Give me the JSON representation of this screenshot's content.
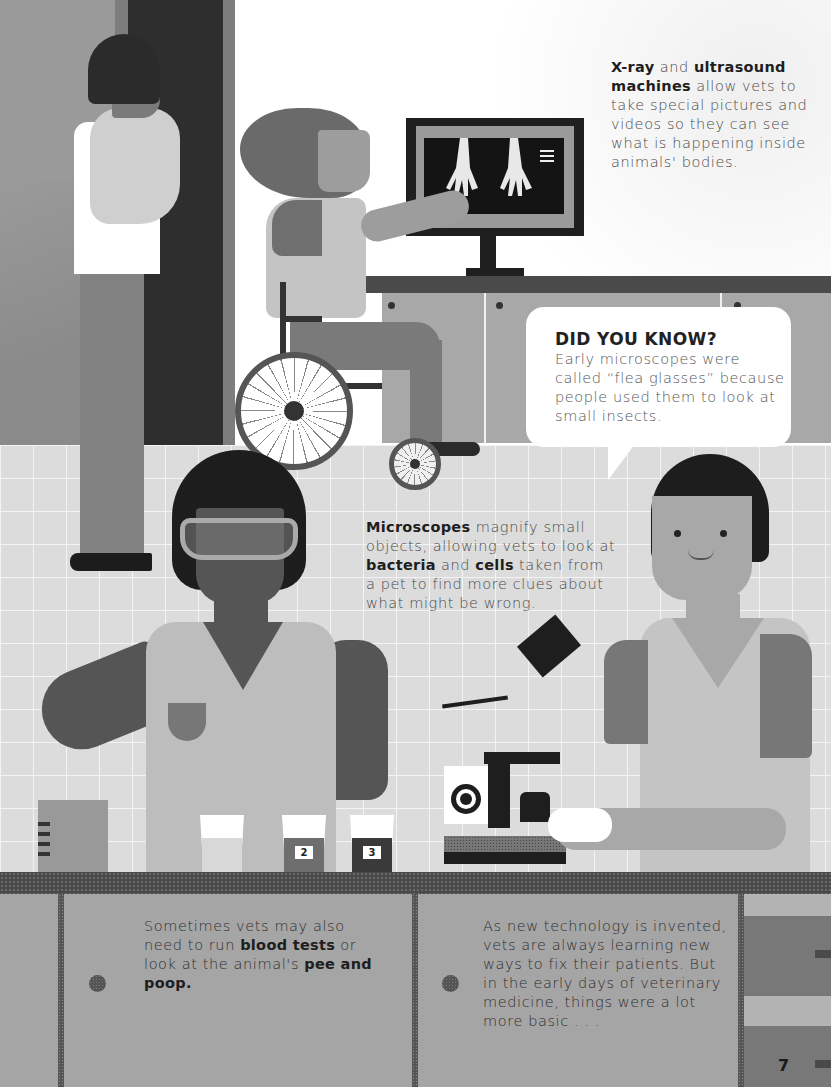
{
  "page": {
    "number": "7",
    "palette": {
      "wall_left": "#9a9a9a",
      "door": "#2e2e2e",
      "window_wall": "#ffffff",
      "floor_grid": "#dcdcdc",
      "counter_top": "#4a4a4a",
      "cabinet": "#a5a5a5",
      "text_dark": "#1e1e1e",
      "text_body": "#4a4a4a"
    }
  },
  "xray_caption": {
    "bold_1": "X-ray",
    "text_1": " and ",
    "bold_2": "ultrasound machines",
    "text_2": " allow vets to take special pictures and videos so they can see what is happening inside animals' bodies."
  },
  "did_you_know": {
    "title": "DID YOU KNOW?",
    "body": "Early microscopes were called “flea glasses” because people used them to look at small insects."
  },
  "microscope_caption": {
    "bold_1": "Microscopes",
    "text_1": " magnify small objects, allowing vets to look at ",
    "bold_2": "bacteria",
    "text_2": " and ",
    "bold_3": "cells",
    "text_3": " taken from a pet to find more clues about what might be wrong."
  },
  "tests_caption": {
    "text_1": "Sometimes vets may also need to run ",
    "bold_1": "blood tests",
    "text_2": " or look at the animal's ",
    "bold_2": "pee and poop."
  },
  "technology_caption": {
    "text": "As new technology is invented, vets are always learning new ways to fix their patients. But in the early days of veterinary medicine, things were a lot more basic . . ."
  },
  "sample_cups": [
    {
      "label": "",
      "fill": "#d8d8d8"
    },
    {
      "label": "2",
      "fill": "#6e6e6e"
    },
    {
      "label": "3",
      "fill": "#3a3a3a"
    }
  ],
  "illustration": {
    "figures": [
      "vet-holding-cat",
      "vet-in-wheelchair-at-xray-monitor",
      "lab-technician-with-goggles",
      "vet-using-microscope"
    ]
  }
}
